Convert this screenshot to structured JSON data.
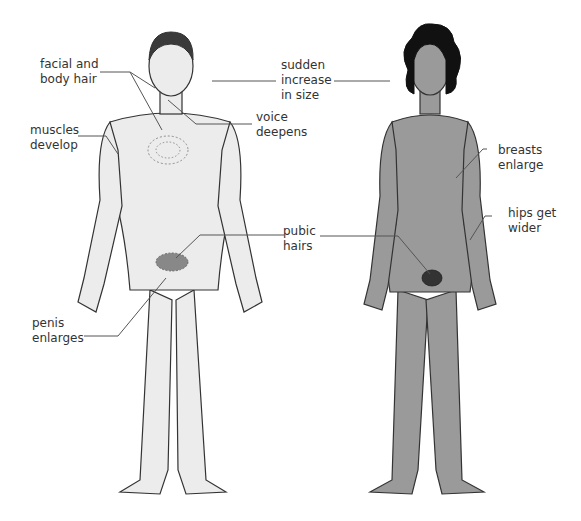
{
  "diagram": {
    "colors": {
      "male_fill": "#ececec",
      "female_fill": "#9a9a9a",
      "outline": "#333333",
      "leader_line": "#555555",
      "hair_male": "#3a3a3a",
      "hair_female": "#111111",
      "text": "#333333"
    },
    "figures": [
      {
        "id": "male",
        "description": "male figure, light fill"
      },
      {
        "id": "female",
        "description": "female figure, dark fill"
      }
    ],
    "labels": {
      "facial_body_hair": "facial and\nbody hair",
      "sudden_increase": "sudden\nincrease\nin size",
      "voice_deepens": "voice\ndeepens",
      "muscles_develop": "muscles\ndevelop",
      "breasts_enlarge": "breasts\nenlarge",
      "hips_wider": "hips get\nwider",
      "pubic_hairs": "pubic\nhairs",
      "penis_enlarges": "penis\nenlarges"
    }
  }
}
